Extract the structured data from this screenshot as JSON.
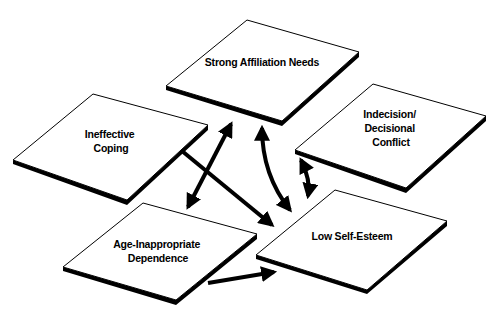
{
  "diagram": {
    "type": "concept-map",
    "nodes": [
      {
        "id": "strong-affiliation-needs",
        "lines": [
          "Strong Affiliation Needs"
        ]
      },
      {
        "id": "ineffective-coping",
        "lines": [
          "Ineffective",
          "Coping"
        ]
      },
      {
        "id": "indecision-decisional-conflict",
        "lines": [
          "Indecision/",
          "Decisional",
          "Conflict"
        ]
      },
      {
        "id": "age-inappropriate-dependence",
        "lines": [
          "Age-Inappropriate",
          "Dependence"
        ]
      },
      {
        "id": "low-self-esteem",
        "lines": [
          "Low Self-Esteem"
        ]
      }
    ],
    "edges": [
      {
        "from": "ineffective-coping",
        "to": "low-self-esteem",
        "direction": "one-way"
      },
      {
        "from": "strong-affiliation-needs",
        "to": "age-inappropriate-dependence",
        "direction": "two-way"
      },
      {
        "from": "strong-affiliation-needs",
        "to": "low-self-esteem",
        "direction": "two-way"
      },
      {
        "from": "indecision-decisional-conflict",
        "to": "low-self-esteem",
        "direction": "two-way"
      },
      {
        "from": "age-inappropriate-dependence",
        "to": "low-self-esteem",
        "direction": "one-way"
      }
    ],
    "colors": {
      "panel_fill": "#ffffff",
      "ink": "#000000",
      "background": "#ffffff"
    }
  }
}
